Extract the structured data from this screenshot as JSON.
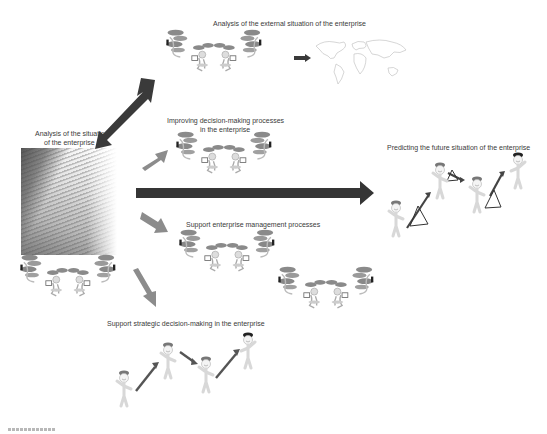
{
  "diagram": {
    "title_cut": "FIGURE 8.x",
    "center": {
      "label_line1": "Analysis of the situation",
      "label_line2": "of the enterprise",
      "image": "skyscraper-photo"
    },
    "nodes": [
      {
        "id": "external",
        "label": "Analysis of the external situation of the enterprise",
        "icon": "networked-people-group + world-map"
      },
      {
        "id": "improving",
        "label_line1": "Improving decision-making processes",
        "label_line2": "in the enterprise",
        "icon": "networked-people-group"
      },
      {
        "id": "predicting",
        "label": "Predicting the future situation of the enterprise",
        "icon": "stick-figures-climbing-with-triangles"
      },
      {
        "id": "support_mgmt",
        "label": "Support enterprise management processes",
        "icon": "two-networked-people-groups"
      },
      {
        "id": "support_strategic",
        "label": "Support strategic decision-making in the enterprise",
        "icon": "stick-figures-climbing-arrows"
      }
    ],
    "edges": [
      {
        "from": "center",
        "to": "external",
        "style": "double-headed dark arrow"
      },
      {
        "from": "center",
        "to": "improving",
        "style": "gray arrow"
      },
      {
        "from": "center",
        "to": "predicting",
        "style": "long dark arrow"
      },
      {
        "from": "center",
        "to": "support_mgmt",
        "style": "gray arrow"
      },
      {
        "from": "center",
        "to": "support_strategic",
        "style": "gray arrow"
      }
    ],
    "colors": {
      "dark_arrow": "#3a3a3a",
      "gray_arrow": "#8c8c8c",
      "text": "#3a3a3a",
      "hat": "#777777",
      "hat_dark": "#222222"
    }
  }
}
